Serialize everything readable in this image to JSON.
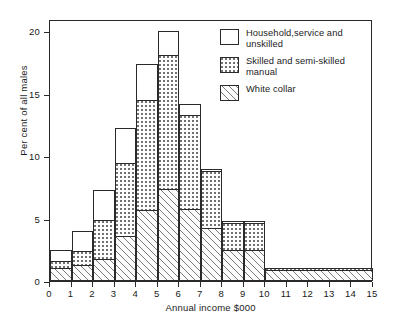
{
  "chart_data": {
    "type": "bar",
    "subtype": "stacked-histogram",
    "title": "",
    "xlabel": "Annual income $000",
    "ylabel": "Per cent of all males",
    "xlim": [
      0,
      15
    ],
    "ylim": [
      0,
      21
    ],
    "grid": false,
    "legend_position": "top-right",
    "xticks": [
      "0",
      "1",
      "2",
      "3",
      "4",
      "5",
      "6",
      "7",
      "8",
      "9",
      "10",
      "11",
      "12",
      "13",
      "14",
      "15"
    ],
    "yticks": [
      "0",
      "5",
      "10",
      "15",
      "20"
    ],
    "categories": [
      "0-1",
      "1-2",
      "2-3",
      "3-4",
      "4-5",
      "5-6",
      "6-7",
      "7-8",
      "8-9",
      "9-10",
      "10-15"
    ],
    "bin_edges": [
      0,
      1,
      2,
      3,
      4,
      5,
      6,
      7,
      8,
      9,
      10,
      15
    ],
    "series": [
      {
        "name": "White collar",
        "pattern": "diagonal-hatch",
        "values": [
          1.0,
          1.2,
          1.7,
          3.5,
          5.6,
          7.3,
          5.7,
          4.2,
          2.4,
          2.4,
          0.8
        ]
      },
      {
        "name": "Skilled and semi-skilled manual",
        "pattern": "dotted",
        "values": [
          0.5,
          1.1,
          3.1,
          5.9,
          8.8,
          10.7,
          7.5,
          4.5,
          2.2,
          2.2,
          0.2
        ]
      },
      {
        "name": "Household, service and unskilled",
        "pattern": "blank",
        "values": [
          0.9,
          1.6,
          2.4,
          2.8,
          2.9,
          2.0,
          0.9,
          0.2,
          0.1,
          0.1,
          0.0
        ]
      }
    ],
    "totals": [
      2.4,
      3.9,
      7.2,
      12.2,
      17.3,
      20.0,
      14.1,
      8.9,
      4.7,
      4.7,
      1.0
    ]
  },
  "legend": {
    "items": [
      {
        "label": "Household,service and unskilled",
        "swatch": "blank-swatch"
      },
      {
        "label": "Skilled and semi-skilled manual",
        "swatch": "dotted-swatch"
      },
      {
        "label": "White collar",
        "swatch": "hatched-swatch"
      }
    ]
  },
  "axes": {
    "x_title": "Annual income $000",
    "y_title": "Per cent of all males"
  }
}
